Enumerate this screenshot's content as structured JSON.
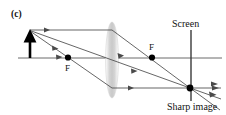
{
  "figure": {
    "panel_label": "(c)",
    "labels": {
      "focal_left": "F",
      "focal_right": "F",
      "screen": "Screen",
      "image": "Sharp image"
    },
    "colors": {
      "ray": "#4a4a4a",
      "axis": "#5a5a5a",
      "object": "#000000",
      "lens_fill": "#d8d8d8",
      "point": "#000000",
      "screen_line": "#3a3a3a",
      "text": "#111111",
      "background": "#ffffff"
    },
    "geometry": {
      "axis_y": 58,
      "axis_x_start": 18,
      "axis_x_end": 222,
      "object_x": 30,
      "object_top_y": 30,
      "lens_center_x": 112,
      "lens_top_y": 22,
      "lens_bottom_y": 98,
      "lens_half_width": 6,
      "focal_left_x": 68,
      "focal_right_x": 152,
      "screen_x": 191,
      "screen_top_y": 30,
      "screen_bottom_y": 100,
      "image_point_x": 190,
      "image_point_y": 88
    },
    "elements": {
      "object_arrow": "upright-object-arrow",
      "lens": "converging-lens",
      "screen": "vertical-screen-line",
      "image_point": "converged-image-point",
      "rays": [
        "parallel-ray-through-far-focus",
        "ray-through-near-focus",
        "ray-through-lens-center"
      ]
    }
  }
}
